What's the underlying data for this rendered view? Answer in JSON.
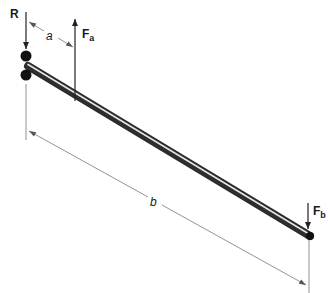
{
  "diagram": {
    "labels": {
      "reaction": "R",
      "force_a_main": "F",
      "force_a_sub": "a",
      "force_b_main": "F",
      "force_b_sub": "b",
      "dim_a": "a",
      "dim_b": "b"
    },
    "colors": {
      "line": "#333333",
      "rod_dark": "#3a3a3a",
      "rod_light": "#d8d8d8",
      "support": "#111111",
      "dim_line": "#777777"
    }
  }
}
